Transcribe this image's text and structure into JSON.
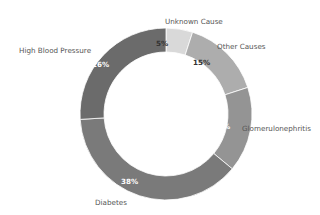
{
  "chart_data": {
    "type": "pie",
    "subtype": "donut",
    "title": "",
    "start_angle": "top (12 o'clock), clockwise",
    "categories": [
      "Unknown Cause",
      "Other Causes",
      "Glomerulonephritis",
      "Diabetes",
      "High Blood Pressure"
    ],
    "values": [
      5,
      15,
      16,
      38,
      26
    ],
    "value_labels": [
      "5%",
      "15%",
      "16%",
      "38%",
      "26%"
    ],
    "colors": [
      "#d9d9d9",
      "#adadad",
      "#949494",
      "#7a7a7a",
      "#6b6b6b"
    ],
    "pct_label_colors": [
      "#333333",
      "#333333",
      "#ffffff",
      "#ffffff",
      "#ffffff"
    ],
    "legend": "none (labels placed outside slices)",
    "grid": false
  },
  "labels": {
    "unknown": "Unknown Cause",
    "other": "Other Causes",
    "glomerulo": "Glomerulonephritis",
    "diabetes": "Diabetes",
    "hbp": "High Blood Pressure"
  },
  "pcts": {
    "unknown": "5%",
    "other": "15%",
    "glomerulo": "16%",
    "diabetes": "38%",
    "hbp": "26%"
  }
}
